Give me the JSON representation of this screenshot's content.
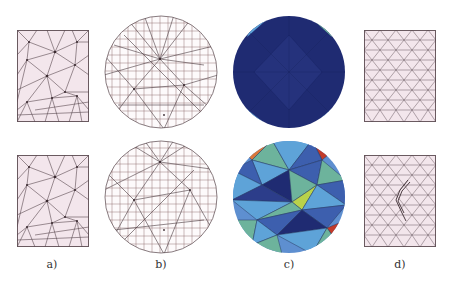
{
  "figure": {
    "labels": [
      "a)",
      "b)",
      "c)",
      "d)"
    ],
    "columns": [
      {
        "id": "a",
        "description": "coarse triangular mesh on rectangle",
        "rows": 2
      },
      {
        "id": "b",
        "description": "wireframe mesh on disk",
        "rows": 2
      },
      {
        "id": "c",
        "description": "color-mapped triangulated disk",
        "rows": 2
      },
      {
        "id": "d",
        "description": "fine triangular mesh on rectangle",
        "rows": 2
      }
    ],
    "colors": {
      "mesh_fill": "#f3e6ec",
      "mesh_line": "#5a4a50",
      "dark_blue": "#1e2a6e",
      "mid_blue": "#3d5fae",
      "light_blue": "#5ea3d8",
      "teal_green": "#6db39c",
      "yellow_green": "#b9d24a",
      "orange": "#d9773a",
      "red": "#c23b2a"
    }
  }
}
